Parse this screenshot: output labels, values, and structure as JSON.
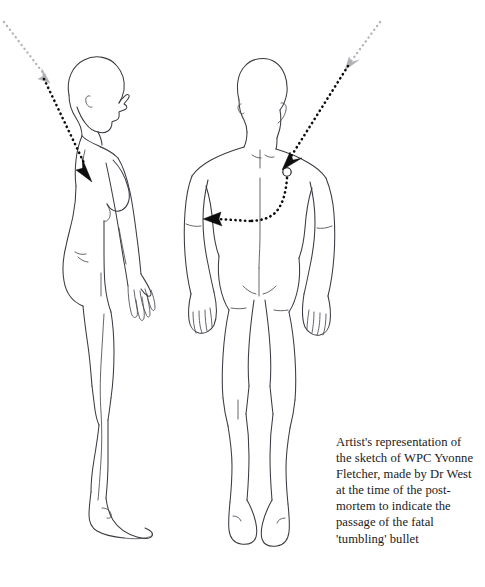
{
  "document": {
    "type": "forensic-illustration",
    "background_color": "#ffffff",
    "line_color": "#3a3a42",
    "trajectory_color": "#0d0d0d",
    "trajectory_faded_color": "#b3b3b8"
  },
  "caption": {
    "lines": [
      "Artist's representation of",
      "the sketch of WPC Yvonne",
      "Fletcher, made by Dr West",
      "at the time of the post-",
      "mortem to indicate the",
      "passage of the fatal",
      "'tumbling' bullet"
    ],
    "full_text": "Artist's representation of the sketch of WPC Yvonne Fletcher, made by Dr West at the time of the post-mortem to indicate the passage of the fatal 'tumbling' bullet"
  },
  "figures": [
    {
      "id": "side-profile-figure",
      "view": "left side profile, facing right",
      "subject": "female body outline",
      "label": "side-view-body"
    },
    {
      "id": "rear-view-figure",
      "view": "posterior / back view",
      "subject": "female body outline",
      "label": "back-view-body"
    }
  ],
  "trajectories": [
    {
      "id": "side-bullet-path",
      "description": "incoming bullet path descending from upper left into the upper back",
      "entry_label": "entry-arrow-side",
      "style": "dotted"
    },
    {
      "id": "back-bullet-path",
      "description": "incoming bullet path descending from upper right into the right upper back, curving down and exiting horizontally to the left flank",
      "entry_label": "entry-arrow-back",
      "exit_label": "exit-arrow-back",
      "style": "dotted"
    }
  ]
}
